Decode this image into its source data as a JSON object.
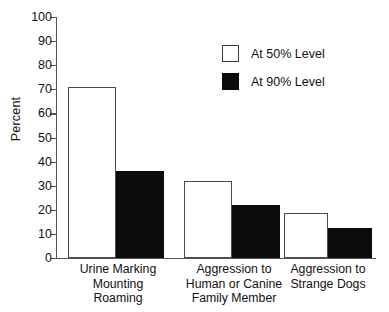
{
  "chart_data": {
    "type": "bar",
    "title": "",
    "xlabel": "",
    "ylabel": "Percent",
    "ylim": [
      0,
      100
    ],
    "yticks": [
      0,
      10,
      20,
      30,
      40,
      50,
      60,
      70,
      80,
      90,
      100
    ],
    "ytick_labels": [
      "0",
      "10",
      "20",
      "30",
      "40",
      "50",
      "60",
      "70",
      "80",
      "90",
      "100"
    ],
    "grid": false,
    "legend_position": "upper right",
    "categories": [
      "Urine Marking Mounting Roaming",
      "Aggression to Human or Canine Family Member",
      "Aggression to Strange Dogs"
    ],
    "category_lines": [
      [
        "Urine Marking",
        "Mounting",
        "Roaming"
      ],
      [
        "Aggression to",
        "Human or Canine",
        "Family Member"
      ],
      [
        "Aggression to",
        "Strange Dogs"
      ]
    ],
    "series": [
      {
        "name": "At 50% Level",
        "color": "#ffffff",
        "edge_color": "#4a4a4a",
        "values": [
          71,
          32,
          18.5
        ]
      },
      {
        "name": "At 90% Level",
        "color": "#0c0c0c",
        "edge_color": "#0c0c0c",
        "values": [
          36,
          22,
          12.5
        ]
      }
    ]
  },
  "axis": {
    "y_title": "Percent"
  },
  "legend": {
    "items": [
      {
        "label": "At 50% Level",
        "style": "light"
      },
      {
        "label": "At 90% Level",
        "style": "dark"
      }
    ]
  }
}
